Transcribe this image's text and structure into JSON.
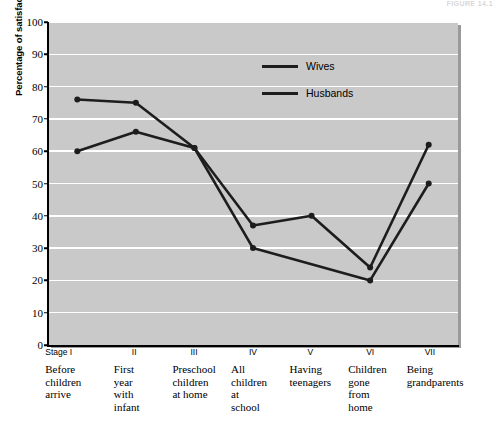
{
  "header": {
    "cut_text": "FIGURE 14.1"
  },
  "chart_data": {
    "type": "line",
    "title": "",
    "xlabel": "",
    "ylabel": "Percentage of satisfaction with marriage",
    "ylim": [
      0,
      100
    ],
    "ytick_step": 10,
    "yticks": [
      0,
      10,
      20,
      30,
      40,
      50,
      60,
      70,
      80,
      90,
      100
    ],
    "grid": true,
    "legend_position": "upper-center-right",
    "categories": [
      "Stage I",
      "II",
      "III",
      "IV",
      "V",
      "VI",
      "VII"
    ],
    "category_descriptions": [
      "Before\nchildren\narrive",
      "First\nyear\nwith\ninfant",
      "Preschool\nchildren\nat home",
      "All\nchildren\nat\nschool",
      "Having\nteenagers",
      "Children\ngone\nfrom\nhome",
      "Being\ngrandparents"
    ],
    "series": [
      {
        "name": "Wives",
        "values": [
          76,
          75,
          61,
          30,
          25,
          20,
          50
        ]
      },
      {
        "name": "Husbands",
        "values": [
          60,
          66,
          61,
          37,
          40,
          24,
          62
        ]
      }
    ],
    "marker_visible": {
      "Wives": [
        true,
        true,
        true,
        true,
        false,
        true,
        true
      ],
      "Husbands": [
        true,
        true,
        true,
        true,
        true,
        true,
        true
      ]
    }
  },
  "colors": {
    "plot_background": "#c9c9c9",
    "gridline": "#ffffff",
    "series_line": "#1d1d1d",
    "axis": "#000000",
    "page_background": "#ffffff"
  }
}
